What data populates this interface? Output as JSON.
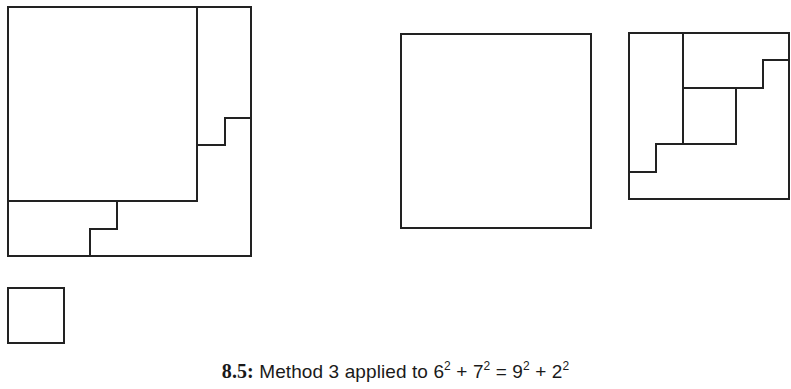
{
  "figure": {
    "number": "8.5:",
    "caption_text": "Method 3 applied to",
    "equation": {
      "terms_left": [
        {
          "base": "6",
          "exp": "2"
        },
        {
          "base": "7",
          "exp": "2"
        }
      ],
      "terms_right": [
        {
          "base": "9",
          "exp": "2"
        },
        {
          "base": "2",
          "exp": "2"
        }
      ],
      "plus": "+",
      "equals": "="
    }
  },
  "style": {
    "stroke_color": "#222222",
    "background": "#ffffff"
  },
  "shapes": {
    "left_figure": {
      "description": "9x9 square containing a 7x7 square with staircase dissection pieces",
      "side_units": 9
    },
    "small_square": {
      "description": "2x2 square",
      "side_units": 2
    },
    "middle_square": {
      "description": "7x7 square",
      "side_units": 7
    },
    "right_figure": {
      "description": "6x6 square dissected into staircase pieces",
      "side_units": 6
    }
  }
}
